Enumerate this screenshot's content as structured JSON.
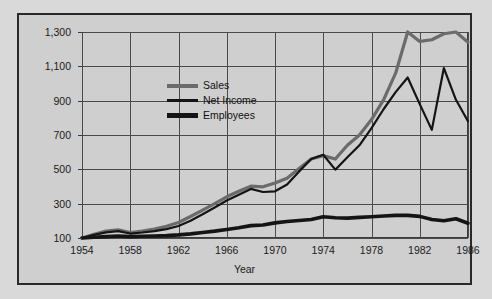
{
  "chart_data": {
    "type": "line",
    "title": "",
    "xlabel": "Year",
    "ylabel": "",
    "xlim": [
      1954,
      1986
    ],
    "ylim": [
      100,
      1300
    ],
    "grid": true,
    "legend_position": "inside-upper-left",
    "x": [
      1954,
      1955,
      1956,
      1957,
      1958,
      1959,
      1960,
      1961,
      1962,
      1963,
      1964,
      1965,
      1966,
      1967,
      1968,
      1969,
      1970,
      1971,
      1972,
      1973,
      1974,
      1975,
      1976,
      1977,
      1978,
      1979,
      1980,
      1981,
      1982,
      1983,
      1984,
      1985,
      1986
    ],
    "xticks": [
      1954,
      1958,
      1962,
      1966,
      1970,
      1974,
      1978,
      1982,
      1986
    ],
    "xticklabels": [
      "1954",
      "1958",
      "1962",
      "1966",
      "1970",
      "1974",
      "1978",
      "1982",
      "1986"
    ],
    "yticks": [
      100,
      300,
      500,
      700,
      900,
      1100,
      1300
    ],
    "yticklabels": [
      "100",
      "300",
      "500",
      "700",
      "900",
      "1,100",
      "1,300"
    ],
    "series": [
      {
        "name": "Sales",
        "color": "#6b6b6b",
        "width": 3.2,
        "values": [
          100,
          122,
          140,
          148,
          132,
          140,
          152,
          168,
          190,
          225,
          262,
          300,
          340,
          372,
          402,
          398,
          420,
          448,
          505,
          560,
          580,
          560,
          640,
          700,
          790,
          905,
          1060,
          1300,
          1245,
          1255,
          1290,
          1300,
          1240
        ]
      },
      {
        "name": "Net Income",
        "color": "#141414",
        "width": 2.2,
        "values": [
          100,
          118,
          133,
          140,
          126,
          132,
          140,
          152,
          170,
          200,
          238,
          278,
          318,
          352,
          386,
          368,
          372,
          412,
          488,
          560,
          585,
          498,
          570,
          640,
          740,
          850,
          950,
          1035,
          880,
          730,
          1090,
          905,
          780
        ]
      },
      {
        "name": "Employees",
        "color": "#141414",
        "width": 3.6,
        "values": [
          100,
          104,
          108,
          112,
          108,
          110,
          112,
          114,
          118,
          124,
          132,
          140,
          150,
          160,
          172,
          176,
          188,
          196,
          202,
          208,
          224,
          218,
          216,
          220,
          224,
          228,
          232,
          232,
          226,
          208,
          200,
          212,
          186
        ]
      }
    ]
  },
  "legend": {
    "items": [
      {
        "label": "Sales"
      },
      {
        "label": "Net Income"
      },
      {
        "label": "Employees"
      }
    ]
  },
  "axes": {
    "x_title": "Year"
  }
}
